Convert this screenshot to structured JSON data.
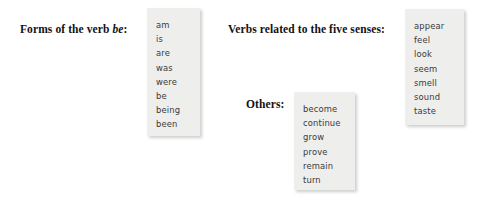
{
  "figure": {
    "background_color": "#ffffff",
    "box_fill_color": "#eeeeec",
    "label_color": "#121212",
    "item_color": "#3a3a3a"
  },
  "groups": [
    {
      "id": "forms-of-be",
      "label_prefix": "Forms of the verb ",
      "label_italic": "be",
      "label_suffix": ":",
      "items": [
        "am",
        "is",
        "are",
        "was",
        "were",
        "be",
        "being",
        "been"
      ]
    },
    {
      "id": "five-senses",
      "label_prefix": "Verbs related to the five senses:",
      "label_italic": "",
      "label_suffix": "",
      "items": [
        "appear",
        "feel",
        "look",
        "seem",
        "smell",
        "sound",
        "taste"
      ]
    },
    {
      "id": "others",
      "label_prefix": "Others:",
      "label_italic": "",
      "label_suffix": "",
      "items": [
        "become",
        "continue",
        "grow",
        "prove",
        "remain",
        "turn"
      ]
    }
  ]
}
